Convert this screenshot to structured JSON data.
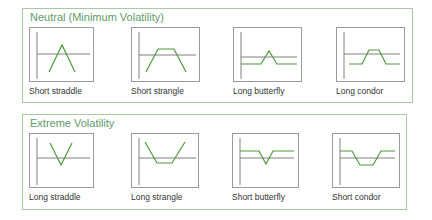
{
  "colors": {
    "panel_border": "#a9c9a4",
    "panel_title": "#5e9b6a",
    "axis": "#808080",
    "payoff": "#4e9a3c",
    "label_text": "#333333"
  },
  "panels": [
    {
      "title": "Neutral (Minimum Volatility)",
      "tiles": [
        {
          "label": "Short straddle",
          "icon": "short-straddle-payoff"
        },
        {
          "label": "Short strangle",
          "icon": "short-strangle-payoff"
        },
        {
          "label": "Long butterfly",
          "icon": "long-butterfly-payoff"
        },
        {
          "label": "Long condor",
          "icon": "long-condor-payoff"
        }
      ]
    },
    {
      "title": "Extreme Volatility",
      "tiles": [
        {
          "label": "Long straddle",
          "icon": "long-straddle-payoff"
        },
        {
          "label": "Long strangle",
          "icon": "long-strangle-payoff"
        },
        {
          "label": "Short butterfly",
          "icon": "short-butterfly-payoff"
        },
        {
          "label": "Short condor",
          "icon": "short-condor-payoff"
        }
      ]
    }
  ]
}
